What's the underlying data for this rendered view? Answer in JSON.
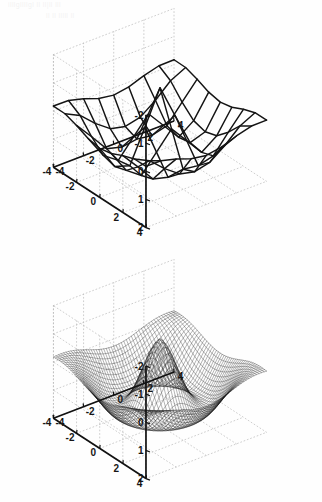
{
  "document": {
    "kind": "scanned-book-page",
    "bleed_through_line_1": "illlgllllgl   ll ll|ll   lll",
    "bleed_through_line_2": "ll ll  lllll ll"
  },
  "figures": [
    {
      "id": "coarse-mesh",
      "name": "top-3d-mesh-plot",
      "render": "wireframe-mesh-coarse",
      "grid_n": 9
    },
    {
      "id": "fine-mesh",
      "name": "bottom-3d-mesh-plot",
      "render": "wireframe-mesh-fine",
      "grid_n": 49
    }
  ],
  "chart_data": [
    {
      "type": "surface",
      "title": "",
      "subtitle": "",
      "xlabel": "",
      "ylabel": "",
      "zlabel": "",
      "render": "mesh",
      "resolution": "coarse",
      "grid_n": 9,
      "xlim": [
        -4,
        4
      ],
      "ylim": [
        -4,
        4
      ],
      "zlim": [
        -2,
        2
      ],
      "xticks": [
        -4,
        -2,
        0,
        2,
        4
      ],
      "yticks": [
        -4,
        -2,
        0,
        2,
        4
      ],
      "zticks": [
        -2,
        -1,
        0,
        1,
        2
      ],
      "xticklabels": [
        "-4",
        "-2",
        "0",
        "2",
        "4"
      ],
      "yticklabels": [
        "4",
        "2",
        "0",
        "-2",
        "-4"
      ],
      "zticklabels": [
        "2",
        "1",
        "0",
        "-1",
        "-2"
      ],
      "grid": true,
      "grid_style": "dotted",
      "legend": "none",
      "view": {
        "azimuth": -37.5,
        "elevation": 30
      },
      "surface_color": "#141414",
      "grid_color": "#b9b9b9",
      "axis_color": "#111111",
      "description": "Coarse wireframe mesh of a radially decaying oscillatory surface with a single sharp central peak near z=1.2 and a surrounding trough near z=-1.3.",
      "z_peak": 1.2,
      "z_trough": -1.3,
      "annotations": []
    },
    {
      "type": "surface",
      "title": "",
      "subtitle": "",
      "xlabel": "",
      "ylabel": "",
      "zlabel": "",
      "render": "mesh",
      "resolution": "fine",
      "grid_n": 49,
      "xlim": [
        -4,
        4
      ],
      "ylim": [
        -4,
        4
      ],
      "zlim": [
        -2,
        2
      ],
      "xticks": [
        -4,
        -2,
        0,
        2,
        4
      ],
      "yticks": [
        -4,
        -2,
        0,
        2,
        4
      ],
      "zticks": [
        -2,
        -1,
        0,
        1,
        2
      ],
      "xticklabels": [
        "-4",
        "-2",
        "0",
        "2",
        "4"
      ],
      "yticklabels": [
        "4",
        "2",
        "0",
        "-2",
        "-4"
      ],
      "zticklabels": [
        "2",
        "1",
        "0",
        "-1",
        "-2"
      ],
      "grid": true,
      "grid_style": "dotted",
      "legend": "none",
      "view": {
        "azimuth": -37.5,
        "elevation": 30
      },
      "surface_color": "#141414",
      "grid_color": "#b9b9b9",
      "axis_color": "#111111",
      "description": "Fine wireframe mesh of the same radially decaying oscillatory surface; the dense grid renders the central peak and the ring-shaped trough smoothly.",
      "z_peak": 1.2,
      "z_trough": -1.35,
      "annotations": []
    }
  ]
}
